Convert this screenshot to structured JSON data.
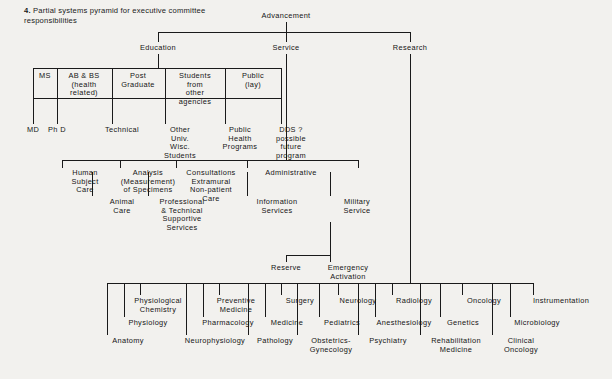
{
  "figure": {
    "number": "4.",
    "caption": "Partial systems pyramid for executive committee responsibilities",
    "background_color": "#f2f1ee",
    "line_color": "#1a1a1a"
  },
  "diagram": {
    "type": "organizational-tree",
    "root": "Advancement",
    "nodes": {
      "root": {
        "label": "Advancement"
      },
      "level1": [
        {
          "label": "Education"
        },
        {
          "label": "Service"
        },
        {
          "label": "Research"
        }
      ],
      "education_boxes": [
        {
          "label": "MS"
        },
        {
          "label": "AB & BS\n(health\nrelated)"
        },
        {
          "label": "Post\nGraduate"
        },
        {
          "label": "Students\nfrom\nother\nagencies"
        },
        {
          "label": "Public\n(lay)"
        }
      ],
      "education_drops": [
        {
          "label": "MD"
        },
        {
          "label": "Ph D"
        },
        {
          "label": "Technical"
        },
        {
          "label": "Other\nUniv.\nWisc.\nStudents"
        },
        {
          "label": "Public\nHealth\nPrograms"
        },
        {
          "label": "DDS ?\npossible\nfuture\nprogram"
        }
      ],
      "service_row": [
        {
          "label": "Human\nSubject\nCare"
        },
        {
          "label": "Analysis\n(Measurement)\nof Specimens"
        },
        {
          "label": "Consultations\nExtramural\nNon-patient\nCare"
        },
        {
          "label": "Administrative"
        }
      ],
      "service_drops": [
        {
          "label": "Animal\nCare"
        },
        {
          "label": "Professional\n& Technical\nSupportive\nServices"
        },
        {
          "label": "Information\nServices"
        },
        {
          "label": "Military\nService"
        }
      ],
      "military_children": [
        {
          "label": "Reserve"
        },
        {
          "label": "Emergency\nActivation"
        }
      ],
      "research_row_top": [
        {
          "label": "Physiological\nChemistry"
        },
        {
          "label": "Preventive\nMedicine"
        },
        {
          "label": "Surgery"
        },
        {
          "label": "Neurology"
        },
        {
          "label": "Radiology"
        },
        {
          "label": "Oncology"
        },
        {
          "label": "Instrumentation"
        }
      ],
      "research_row_mid": [
        {
          "label": "Physiology"
        },
        {
          "label": "Pharmacology"
        },
        {
          "label": "Medicine"
        },
        {
          "label": "Pediatrics"
        },
        {
          "label": "Anesthesiology"
        },
        {
          "label": "Genetics"
        },
        {
          "label": "Microbiology"
        }
      ],
      "research_row_bottom": [
        {
          "label": "Anatomy"
        },
        {
          "label": "Neurophysiology"
        },
        {
          "label": "Pathology"
        },
        {
          "label": "Obstetrics-\nGynecology"
        },
        {
          "label": "Psychiatry"
        },
        {
          "label": "Rehabilitation\nMedicine"
        },
        {
          "label": "Clinical\nOncology"
        }
      ]
    }
  }
}
